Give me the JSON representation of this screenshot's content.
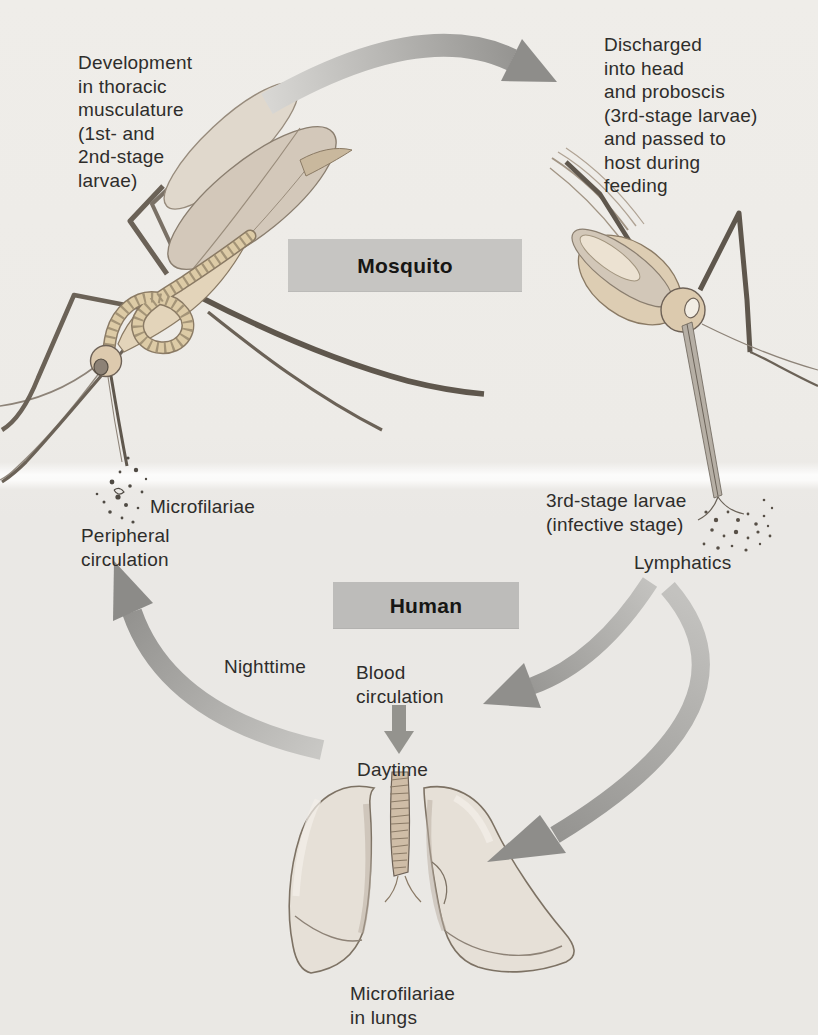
{
  "figure": {
    "host_boxes": {
      "mosquito": "Mosquito",
      "human": "Human"
    },
    "labels": {
      "development": "Development\nin thoracic\nmusculature\n(1st- and\n2nd-stage\nlarvae)",
      "discharged": "Discharged\ninto head\nand proboscis\n(3rd-stage larvae)\nand passed to\nhost during\nfeeding",
      "microfilariae": "Microfilariae",
      "peripheral_circulation": "Peripheral\ncirculation",
      "third_stage_larvae": "3rd-stage larvae\n(infective stage)",
      "lymphatics": "Lymphatics",
      "nighttime": "Nighttime",
      "blood_circulation": "Blood\ncirculation",
      "daytime": "Daytime",
      "microfilariae_in_lungs": "Microfilariae\nin lungs"
    },
    "illustrations": [
      "mosquito-illustration-left",
      "mosquito-illustration-right",
      "lungs-illustration",
      "microfilariae-speckles",
      "larvae-speckles"
    ],
    "arrows": [
      "arrow-mosquito-to-human-transfer",
      "arrow-nighttime-to-peripheral",
      "arrow-lymphatics-to-blood-circulation",
      "arrow-lymphatics-to-lungs",
      "arrow-blood-circulation-to-daytime"
    ],
    "colors": {
      "background": "#edebe7",
      "host_box": "#c6c5c2",
      "arrow": "#999894",
      "text": "#2e2d2b",
      "body_tan": "#ddcdb3",
      "wing_gray": "#d3c8ba"
    }
  }
}
